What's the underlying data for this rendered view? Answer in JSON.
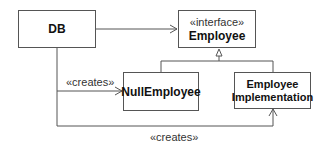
{
  "diagram": {
    "type": "UML class diagram",
    "classes": [
      {
        "id": "db",
        "name": "DB"
      },
      {
        "id": "employee",
        "stereotype": "«interface»",
        "name": "Employee"
      },
      {
        "id": "null_employee",
        "name": "NullEmployee"
      },
      {
        "id": "employee_impl",
        "name_line1": "Employee",
        "name_line2": "Implementation"
      }
    ],
    "relations": [
      {
        "from": "db",
        "to": "employee",
        "kind": "dependency"
      },
      {
        "from": "null_employee",
        "to": "employee",
        "kind": "realization"
      },
      {
        "from": "employee_impl",
        "to": "employee",
        "kind": "realization"
      },
      {
        "from": "db",
        "to": "null_employee",
        "kind": "dependency",
        "label": "«creates»"
      },
      {
        "from": "db",
        "to": "employee_impl",
        "kind": "dependency",
        "label": "«creates»"
      }
    ],
    "colors": {
      "line": "#555555",
      "text": "#111111",
      "background": "#ffffff"
    }
  }
}
